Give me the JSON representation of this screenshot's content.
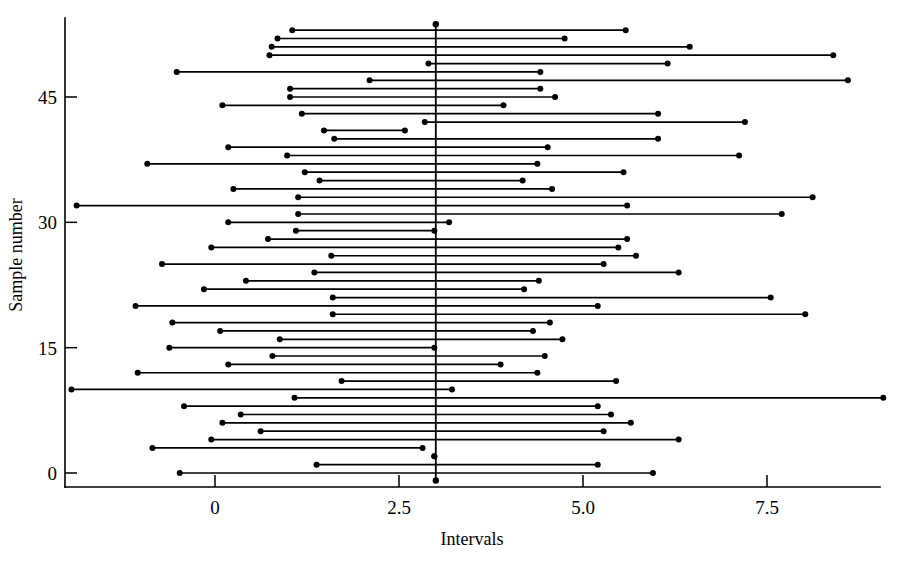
{
  "chart_data": {
    "type": "line",
    "subtype": "confidence-interval-plot",
    "title": "",
    "xlabel": "Intervals",
    "ylabel": "Sample number",
    "xlim": [
      -1.9,
      9.3
    ],
    "ylim": [
      -1.5,
      54.5
    ],
    "xticks": [
      0,
      2.5,
      5.0,
      7.5
    ],
    "xticklabels": [
      "0",
      "2.5",
      "5.0",
      "7.5"
    ],
    "yticks": [
      0,
      15,
      30,
      45
    ],
    "yticklabels": [
      "0",
      "15",
      "30",
      "45"
    ],
    "grid": false,
    "legend": null,
    "reference_line": {
      "orientation": "vertical",
      "value": 3.0,
      "label": "",
      "y_from": -0.9,
      "y_to": 53.7,
      "endpoint_markers": true
    },
    "marker": "filled-circle",
    "series_name": "confidence intervals",
    "intervals": [
      {
        "sample": 53,
        "lower": 1.05,
        "upper": 5.58
      },
      {
        "sample": 52,
        "lower": 0.85,
        "upper": 4.75
      },
      {
        "sample": 51,
        "lower": 0.77,
        "upper": 6.45
      },
      {
        "sample": 50,
        "lower": 0.74,
        "upper": 8.4
      },
      {
        "sample": 49,
        "lower": 2.9,
        "upper": 6.15
      },
      {
        "sample": 48,
        "lower": -0.52,
        "upper": 4.42
      },
      {
        "sample": 47,
        "lower": 2.1,
        "upper": 8.6
      },
      {
        "sample": 46,
        "lower": 1.02,
        "upper": 4.42
      },
      {
        "sample": 45,
        "lower": 1.02,
        "upper": 4.62
      },
      {
        "sample": 44,
        "lower": 0.1,
        "upper": 3.92
      },
      {
        "sample": 43,
        "lower": 1.18,
        "upper": 6.02
      },
      {
        "sample": 42,
        "lower": 2.85,
        "upper": 7.2
      },
      {
        "sample": 41,
        "lower": 1.48,
        "upper": 2.58
      },
      {
        "sample": 40,
        "lower": 1.62,
        "upper": 6.02
      },
      {
        "sample": 39,
        "lower": 0.18,
        "upper": 4.52
      },
      {
        "sample": 38,
        "lower": 0.98,
        "upper": 7.12
      },
      {
        "sample": 37,
        "lower": -0.92,
        "upper": 4.38
      },
      {
        "sample": 36,
        "lower": 1.22,
        "upper": 5.55
      },
      {
        "sample": 35,
        "lower": 1.42,
        "upper": 4.18
      },
      {
        "sample": 34,
        "lower": 0.25,
        "upper": 4.58
      },
      {
        "sample": 33,
        "lower": 1.13,
        "upper": 8.12
      },
      {
        "sample": 32,
        "lower": -1.88,
        "upper": 5.6
      },
      {
        "sample": 31,
        "lower": 1.13,
        "upper": 7.7
      },
      {
        "sample": 30,
        "lower": 0.18,
        "upper": 3.18
      },
      {
        "sample": 29,
        "lower": 1.1,
        "upper": 2.98
      },
      {
        "sample": 28,
        "lower": 0.72,
        "upper": 5.6
      },
      {
        "sample": 27,
        "lower": -0.05,
        "upper": 5.48
      },
      {
        "sample": 26,
        "lower": 1.58,
        "upper": 5.72
      },
      {
        "sample": 25,
        "lower": -0.72,
        "upper": 5.28
      },
      {
        "sample": 24,
        "lower": 1.35,
        "upper": 6.3
      },
      {
        "sample": 23,
        "lower": 0.42,
        "upper": 4.4
      },
      {
        "sample": 22,
        "lower": -0.15,
        "upper": 4.2
      },
      {
        "sample": 21,
        "lower": 1.6,
        "upper": 7.55
      },
      {
        "sample": 20,
        "lower": -1.08,
        "upper": 5.2
      },
      {
        "sample": 19,
        "lower": 1.6,
        "upper": 8.02
      },
      {
        "sample": 18,
        "lower": -0.58,
        "upper": 4.55
      },
      {
        "sample": 17,
        "lower": 0.07,
        "upper": 4.32
      },
      {
        "sample": 16,
        "lower": 0.88,
        "upper": 4.72
      },
      {
        "sample": 15,
        "lower": -0.62,
        "upper": 2.98
      },
      {
        "sample": 14,
        "lower": 0.78,
        "upper": 4.48
      },
      {
        "sample": 13,
        "lower": 0.18,
        "upper": 3.88
      },
      {
        "sample": 12,
        "lower": -1.05,
        "upper": 4.38
      },
      {
        "sample": 11,
        "lower": 1.72,
        "upper": 5.45
      },
      {
        "sample": 10,
        "lower": -1.95,
        "upper": 3.22
      },
      {
        "sample": 9,
        "lower": 1.08,
        "upper": 9.08
      },
      {
        "sample": 8,
        "lower": -0.42,
        "upper": 5.2
      },
      {
        "sample": 7,
        "lower": 0.35,
        "upper": 5.38
      },
      {
        "sample": 6,
        "lower": 0.1,
        "upper": 5.65
      },
      {
        "sample": 5,
        "lower": 0.62,
        "upper": 5.28
      },
      {
        "sample": 4,
        "lower": -0.05,
        "upper": 6.3
      },
      {
        "sample": 3,
        "lower": -0.85,
        "upper": 2.82
      },
      {
        "sample": 2,
        "lower": 2.98,
        "upper": 2.98
      },
      {
        "sample": 1,
        "lower": 1.38,
        "upper": 5.2
      },
      {
        "sample": 0,
        "lower": -0.48,
        "upper": 5.95
      }
    ]
  },
  "axes": {
    "x_axis_name": "x-axis",
    "y_axis_name": "y-axis"
  }
}
